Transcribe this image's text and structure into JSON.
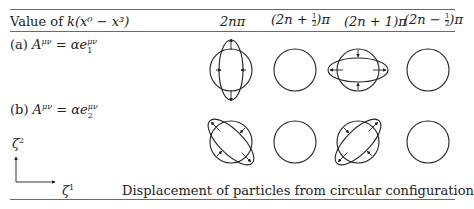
{
  "header": {
    "row_label": "Value of",
    "row_label_expr": "k(x⁰ − x³)",
    "columns": [
      {
        "id": "col-2npi",
        "label": "2nπ"
      },
      {
        "id": "col-2n-plus-half-pi",
        "prefix": "(2n + ",
        "num": "1",
        "den": "2",
        "suffix": ")π"
      },
      {
        "id": "col-2n-plus-1-pi",
        "label": "(2n + 1)π"
      },
      {
        "id": "col-2n-minus-half-pi",
        "prefix": "(2n − ",
        "num": "1",
        "den": "2",
        "suffix": ")π"
      }
    ]
  },
  "rows": [
    {
      "tag": "(a)",
      "lhs": "A",
      "lhs_sup": "μν",
      "rhs": "= αe",
      "rhs_sub": "1",
      "rhs_sup": "μν",
      "shapes": [
        "ellipse-vertical",
        "circle",
        "ellipse-horizontal",
        "circle"
      ]
    },
    {
      "tag": "(b)",
      "lhs": "A",
      "lhs_sup": "μν",
      "rhs": "= αe",
      "rhs_sub": "2",
      "rhs_sup": "μν",
      "shapes": [
        "ellipse-diagonal-down",
        "circle",
        "ellipse-diagonal-up",
        "circle"
      ]
    }
  ],
  "axes": {
    "y_label": "ζ",
    "y_sup": "2",
    "x_label": "ζ",
    "x_sup": "1"
  },
  "caption": "Displacement of particles from circular configuration",
  "colors": {
    "ink": "#222222",
    "rule": "#6a6a6a"
  }
}
